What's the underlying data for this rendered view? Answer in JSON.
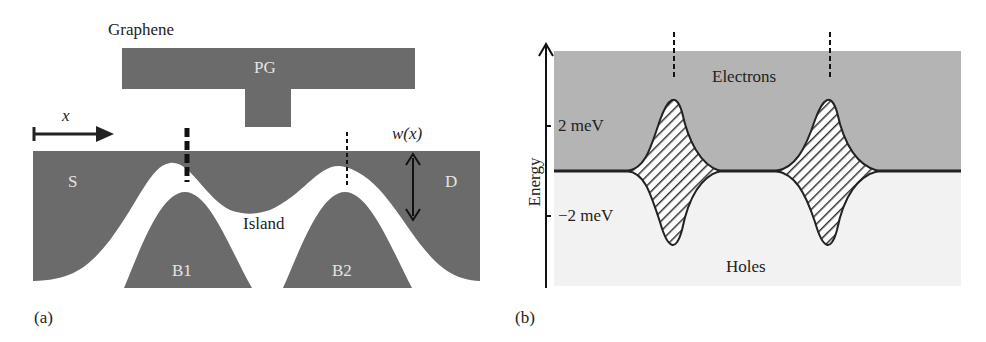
{
  "panel_a": {
    "caption": "(a)",
    "title": "Graphene",
    "gate_label": "PG",
    "x_axis_label": "x",
    "width_label": "w(x)",
    "source_label": "S",
    "drain_label": "D",
    "island_label": "Island",
    "barrier1_label": "B1",
    "barrier2_label": "B2",
    "colors": {
      "graphene": "#6b6b6b",
      "background": "#ffffff"
    }
  },
  "panel_b": {
    "caption": "(b)",
    "y_axis_label": "Energy",
    "tick_pos": "2 meV",
    "tick_neg": "−2 meV",
    "upper_region_label": "Electrons",
    "lower_region_label": "Holes",
    "colors": {
      "electrons": "#b4b4b4",
      "holes": "#f2f2f2",
      "hatch": "#333333"
    }
  }
}
